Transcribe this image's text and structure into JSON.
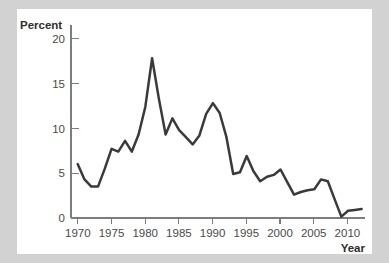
{
  "figure": {
    "background_color": "#d2d2d2",
    "card_color": "#ffffff"
  },
  "chart_data": {
    "type": "line",
    "title": "",
    "subtitle": "",
    "xlabel": "Year",
    "ylabel": "Percent",
    "xlim": [
      1969,
      2012.5
    ],
    "ylim": [
      0,
      21.5
    ],
    "xticks": [
      1970,
      1975,
      1980,
      1985,
      1990,
      1995,
      2000,
      2005,
      2010
    ],
    "xtick_labels": [
      "1970",
      "1975",
      "1980",
      "1985",
      "1990",
      "1995",
      "2000",
      "2005",
      "2010"
    ],
    "yticks": [
      0,
      5,
      10,
      15,
      20
    ],
    "ytick_labels": [
      "0",
      "5",
      "10",
      "15",
      "20"
    ],
    "grid": false,
    "legend": "none",
    "line_color": "#3a3a3a",
    "axis_color": "#7d7d7d",
    "x": [
      1970,
      1971,
      1972,
      1973,
      1974,
      1975,
      1976,
      1977,
      1978,
      1979,
      1980,
      1981,
      1982,
      1983,
      1984,
      1985,
      1986,
      1987,
      1988,
      1989,
      1990,
      1991,
      1992,
      1993,
      1994,
      1995,
      1996,
      1997,
      1998,
      1999,
      2000,
      2001,
      2002,
      2003,
      2004,
      2005,
      2006,
      2007,
      2008,
      2009,
      2010,
      2011,
      2012
    ],
    "values": [
      6.0,
      4.3,
      3.5,
      3.5,
      5.5,
      7.7,
      7.4,
      8.6,
      7.4,
      9.3,
      12.4,
      17.8,
      13.3,
      9.3,
      11.1,
      9.8,
      9.0,
      8.2,
      9.2,
      11.6,
      12.8,
      11.7,
      9.0,
      4.9,
      5.1,
      6.9,
      5.2,
      4.1,
      4.6,
      4.8,
      5.4,
      4.0,
      2.6,
      2.9,
      3.1,
      3.2,
      4.3,
      4.1,
      2.1,
      0.15,
      0.8,
      0.9,
      1.0
    ],
    "peaks": [
      {
        "year": 1981,
        "value": 17.8
      },
      {
        "year": 1990,
        "value": 12.8
      }
    ],
    "minimum": {
      "year": 2009,
      "value": 0.15
    }
  }
}
